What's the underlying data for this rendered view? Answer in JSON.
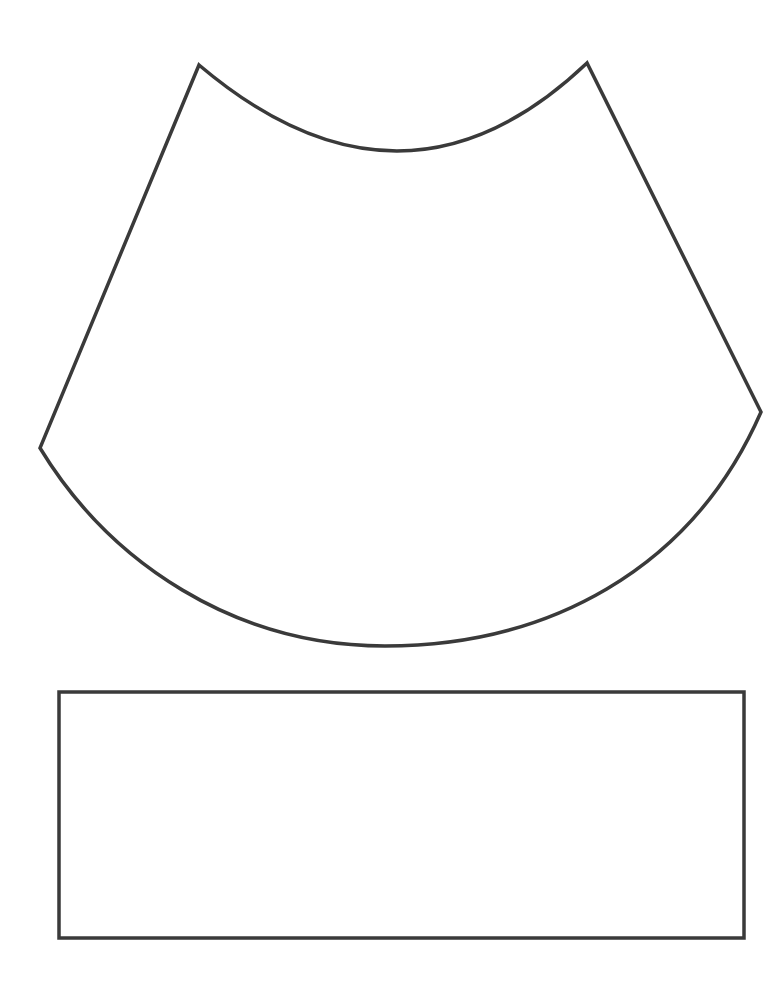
{
  "page": {
    "background": "#ffffff",
    "stroke_color": "#3a3a3a"
  },
  "shapes": [
    {
      "name": "cone-sector",
      "type": "annular-sector",
      "corners": {
        "top_left": [
          199,
          65
        ],
        "top_right": [
          587,
          63
        ],
        "bottom_left": [
          40,
          448
        ],
        "bottom_right": [
          761,
          412
        ]
      },
      "top_arc_low_point": [
        398,
        151
      ],
      "bottom_arc_low_point": [
        385,
        646
      ]
    },
    {
      "name": "rectangle-strip",
      "type": "rectangle",
      "x": 59,
      "y": 692,
      "width": 685,
      "height": 246
    }
  ]
}
